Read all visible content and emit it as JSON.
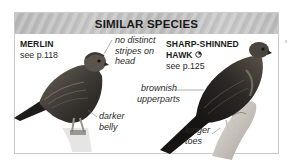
{
  "header": {
    "title": "SIMILAR SPECIES"
  },
  "species": [
    {
      "name": "MERLIN",
      "page_ref": "see p.118",
      "icon": null,
      "annotations": [
        {
          "lines": [
            "no distinct",
            "stripes on",
            "head"
          ]
        },
        {
          "lines": [
            "darker",
            "belly"
          ]
        }
      ]
    },
    {
      "name_line1": "SHARP-SHINNED",
      "name_line2": "HAWK",
      "page_ref": "see p.125",
      "icon": "range-map-quarter-circle-icon",
      "annotations": [
        {
          "lines": [
            "brownish",
            "upperparts"
          ]
        },
        {
          "lines": [
            "longer",
            "toes"
          ]
        }
      ]
    }
  ],
  "colors": {
    "header_bg": "#c0c0c0",
    "border": "#c9c9c9",
    "text": "#1a1a1a",
    "leader_line": "#7a7a7a"
  }
}
